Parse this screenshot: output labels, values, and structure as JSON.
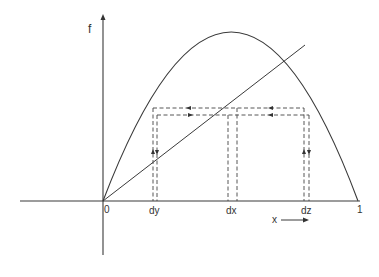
{
  "diagram": {
    "type": "iterated-map cobweb diagram",
    "axes": {
      "y_label": "f",
      "origin_label": "0",
      "x_end_label": "1",
      "x_direction_label": "x"
    },
    "tick_labels": {
      "dy": "dy",
      "dx": "dx",
      "dz": "dz"
    },
    "elements": {
      "curve": "parabola f(x) from 0 to 1 (peak near middle)",
      "diagonal": "identity line f = x",
      "cobweb": "dashed rectangular paths between curve and diagonal with direction arrows"
    },
    "colors": {
      "ink": "#333333",
      "background": "#ffffff"
    }
  }
}
